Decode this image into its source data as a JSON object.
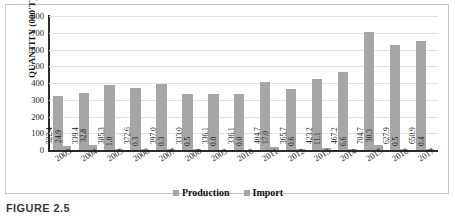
{
  "figure": {
    "caption": "FIGURE 2.5"
  },
  "legend": {
    "position": "bottom-center",
    "entries": [
      {
        "label": "Production",
        "color": "#a6a6a6",
        "swatch": "square-marker-icon"
      },
      {
        "label": "Import",
        "color": "#a6a6a6",
        "swatch": "square-marker-icon"
      }
    ]
  },
  "chart_data": {
    "type": "bar",
    "title": "",
    "subtitle": "",
    "xlabel": "",
    "ylabel": "QUANTITY (000'T)",
    "ylim": [
      0,
      800
    ],
    "ytick_step": 100,
    "yticks": [
      "800",
      "700",
      "600",
      "500",
      "400",
      "300",
      "200",
      "100",
      "0"
    ],
    "grid": true,
    "grid_axis": "y",
    "categories": [
      "2003",
      "2004",
      "2005",
      "2006",
      "2007",
      "2008",
      "2009",
      "2010",
      "2011",
      "2012",
      "2013",
      "2014",
      "2015",
      "2016",
      "2017"
    ],
    "series": [
      {
        "name": "Production",
        "color": "#a6a6a6",
        "values": [
          322.4,
          339.4,
          385.3,
          372.6,
          397.0,
          333.0,
          336.1,
          336.1,
          404.7,
          365.7,
          423.2,
          467.2,
          704.7,
          627.9,
          650.9
        ],
        "labels": [
          "322.4",
          "339.4",
          "385.3",
          "372.6",
          "397.0",
          "333.0",
          "336.1",
          "336.1",
          "404.7",
          "365.7",
          "423.2",
          "467.2",
          "704.7",
          "627.9",
          "650.9"
        ]
      },
      {
        "name": "Import",
        "color": "#a6a6a6",
        "values": [
          24.9,
          32.8,
          1.0,
          0.3,
          0.3,
          0.5,
          0.0,
          0.0,
          17.0,
          0.6,
          11.1,
          6.6,
          30.3,
          0.5,
          0.4
        ],
        "labels": [
          "24.9",
          "32.8",
          "1.0",
          "0.3",
          "0.3",
          "0.5",
          "0.0",
          "0.0",
          "17.0",
          "0.6",
          "11.1",
          "6.6",
          "30.3",
          "0.5",
          "0.4"
        ]
      }
    ]
  }
}
